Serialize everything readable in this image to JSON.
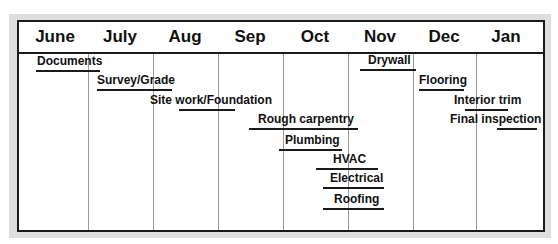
{
  "chart_data": {
    "type": "gantt",
    "title": "",
    "categories": [
      "June",
      "July",
      "Aug",
      "Sep",
      "Oct",
      "Nov",
      "Dec",
      "Jan"
    ],
    "grid": true,
    "tasks": [
      {
        "name": "Documents",
        "label_x": 37,
        "bar_start": 36,
        "bar_end": 100,
        "y": 70,
        "start_month": 0.0,
        "end_month": 1.0
      },
      {
        "name": "Survey/Grade",
        "label_x": 97,
        "bar_start": 97,
        "bar_end": 172,
        "y": 89,
        "start_month": 0.95,
        "end_month": 2.25
      },
      {
        "name": "Site work/Foundation",
        "label_x": 150,
        "bar_start": 179,
        "bar_end": 235,
        "y": 109,
        "start_month": 2.4,
        "end_month": 3.25
      },
      {
        "name": "Rough carpentry",
        "label_x": 258,
        "bar_start": 249,
        "bar_end": 358,
        "y": 128,
        "start_month": 3.45,
        "end_month": 5.15
      },
      {
        "name": "Plumbing",
        "label_x": 285,
        "bar_start": 279,
        "bar_end": 342,
        "y": 149,
        "start_month": 3.95,
        "end_month": 4.9
      },
      {
        "name": "HVAC",
        "label_x": 333,
        "bar_start": 316,
        "bar_end": 378,
        "y": 168,
        "start_month": 4.5,
        "end_month": 5.45
      },
      {
        "name": "Electrical",
        "label_x": 330,
        "bar_start": 323,
        "bar_end": 384,
        "y": 187,
        "start_month": 4.6,
        "end_month": 5.55
      },
      {
        "name": "Roofing",
        "label_x": 334,
        "bar_start": 323,
        "bar_end": 384,
        "y": 208,
        "start_month": 4.6,
        "end_month": 5.55
      },
      {
        "name": "Drywall",
        "label_x": 368,
        "bar_start": 360,
        "bar_end": 416,
        "y": 69,
        "start_month": 5.2,
        "end_month": 6.05
      },
      {
        "name": "Flooring",
        "label_x": 419,
        "bar_start": 419,
        "bar_end": 464,
        "y": 89,
        "start_month": 6.1,
        "end_month": 6.8
      },
      {
        "name": "Interior trim",
        "label_x": 454,
        "bar_start": 465,
        "bar_end": 508,
        "y": 109,
        "start_month": 6.8,
        "end_month": 7.5
      },
      {
        "name": "Final inspection",
        "label_x": 450,
        "bar_start": 497,
        "bar_end": 537,
        "y": 128,
        "start_month": 7.3,
        "end_month": 7.95
      }
    ]
  }
}
